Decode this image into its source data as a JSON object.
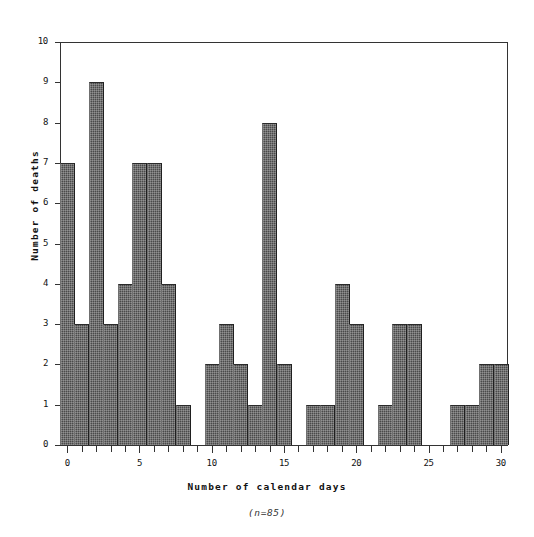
{
  "chart_data": {
    "type": "bar",
    "title": "",
    "xlabel": "Number of calendar days",
    "ylabel": "Number of deaths",
    "caption": "(n=85)",
    "xlim": [
      -0.5,
      30.5
    ],
    "ylim": [
      0,
      10
    ],
    "grid": false,
    "legend": null,
    "x_tick_labels": [
      "0",
      "5",
      "10",
      "15",
      "20",
      "25",
      "30"
    ],
    "x_tick_values": [
      0,
      5,
      10,
      15,
      20,
      25,
      30
    ],
    "x_minor_ticks_every": 1,
    "y_tick_labels": [
      "0",
      "1",
      "2",
      "3",
      "4",
      "5",
      "6",
      "7",
      "8",
      "9",
      "10"
    ],
    "y_tick_values": [
      0,
      1,
      2,
      3,
      4,
      5,
      6,
      7,
      8,
      9,
      10
    ],
    "categories": [
      0,
      1,
      2,
      3,
      4,
      5,
      6,
      7,
      8,
      9,
      10,
      11,
      12,
      13,
      14,
      15,
      16,
      17,
      18,
      19,
      20,
      21,
      22,
      23,
      24,
      25,
      26,
      27,
      28,
      29,
      30
    ],
    "values": [
      7,
      3,
      9,
      3,
      4,
      7,
      7,
      4,
      1,
      0,
      2,
      3,
      2,
      1,
      8,
      2,
      0,
      1,
      1,
      4,
      3,
      0,
      1,
      3,
      3,
      0,
      0,
      1,
      1,
      2,
      2
    ],
    "total": 85,
    "bar_color": "#4a4a4a",
    "axis_color": "#333333"
  },
  "figure": {
    "background": "#ffffff"
  }
}
